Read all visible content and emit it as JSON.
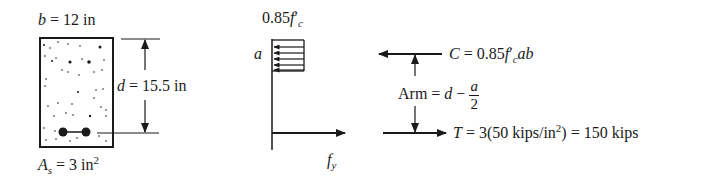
{
  "section": {
    "width_label": {
      "var": "b",
      "eq": " = 12 in"
    },
    "depth_label": {
      "var": "d",
      "eq": " = 15.5 in"
    },
    "steel_label": {
      "var": "A",
      "sub": "s",
      "eq": " = 3 in",
      "sup": "2"
    },
    "rebar_count": 2
  },
  "stress": {
    "top_label": {
      "prefix": "0.85",
      "var": "f",
      "prime": "′",
      "sub": "c"
    },
    "block_label": "a",
    "bottom_label": {
      "var": "f",
      "sub": "y"
    }
  },
  "forces": {
    "compression": {
      "var": "C",
      "eq": " = 0.85",
      "f": "f",
      "prime": "′",
      "sub": "c",
      "tail": "ab"
    },
    "arm": {
      "text": "Arm = ",
      "d": "d",
      "minus": " − ",
      "num": "a",
      "den": "2"
    },
    "tension": {
      "var": "T",
      "eq": " = 3(50 kips/in",
      "sup": "2",
      "tail": ") = 150 kips"
    }
  },
  "colors": {
    "ink": "#1a1a1a"
  }
}
